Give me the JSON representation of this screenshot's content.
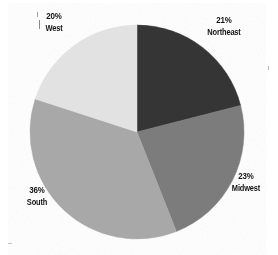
{
  "chart_data": {
    "type": "pie",
    "title": "",
    "categories": [
      "Northeast",
      "Midwest",
      "South",
      "West"
    ],
    "values": [
      21,
      23,
      36,
      20
    ],
    "value_labels": [
      "21%",
      "23%",
      "36%",
      "20%"
    ],
    "units": "percent",
    "start_angle_deg": 0,
    "direction": "clockwise",
    "legend": "none",
    "labels_position": "outside",
    "slices": [
      {
        "name": "Northeast",
        "value": 21,
        "pct_label": "21%",
        "color": "#353535"
      },
      {
        "name": "Midwest",
        "value": 23,
        "pct_label": "23%",
        "color": "#7c7c7c"
      },
      {
        "name": "South",
        "value": 36,
        "pct_label": "36%",
        "color": "#a8a8a8"
      },
      {
        "name": "West",
        "value": 20,
        "pct_label": "20%",
        "color": "#e2e2e2"
      }
    ]
  },
  "labels": {
    "northeast": {
      "pct": "21%",
      "name": "Northeast"
    },
    "midwest": {
      "pct": "23%",
      "name": "Midwest"
    },
    "south": {
      "pct": "36%",
      "name": "South"
    },
    "west": {
      "pct": "20%",
      "name": "West"
    }
  },
  "geometry": {
    "center_x": 137,
    "center_y": 132,
    "radius": 107
  },
  "colors": {
    "background": "#ffffff",
    "text": "#141414",
    "northeast": "#353535",
    "midwest": "#7c7c7c",
    "south": "#a8a8a8",
    "west": "#e2e2e2"
  }
}
